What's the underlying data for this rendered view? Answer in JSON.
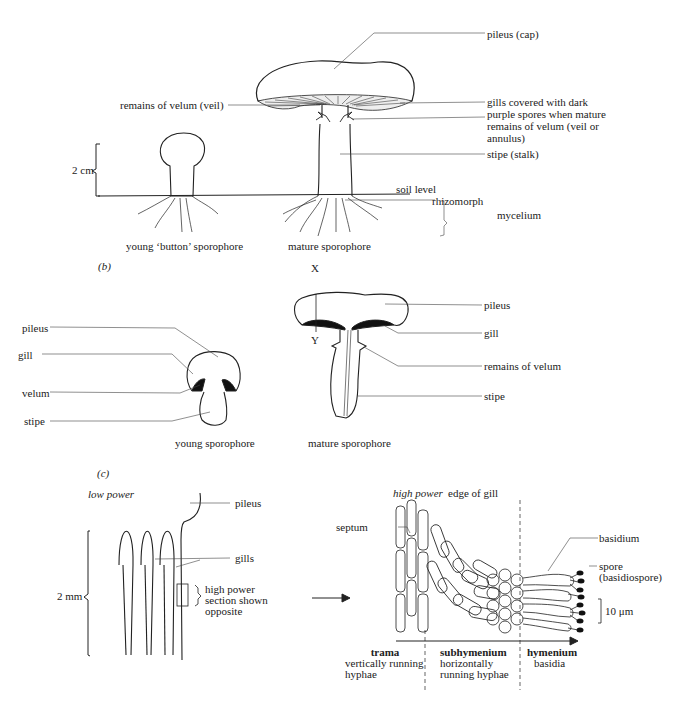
{
  "panel_a": {
    "labels": {
      "pileus": "pileus (cap)",
      "velum": "remains of velum (veil)",
      "gills_line1": "gills covered with dark",
      "gills_line2": "purple spores when mature",
      "annulus_line1": "remains of velum (veil or",
      "annulus_line2": "annulus)",
      "stipe": "stipe (stalk)",
      "soil": "soil level",
      "rhizomorph": "rhizomorph",
      "mycelium": "mycelium",
      "scale": "2 cm",
      "caption_young": "young ‘button’ sporophore",
      "caption_mature": "mature sporophore"
    }
  },
  "panel_b": {
    "tag": "(b)",
    "labels": {
      "x": "X",
      "y": "Y",
      "young_pileus": "pileus",
      "young_gill": "gill",
      "young_velum": "velum",
      "young_stipe": "stipe",
      "mature_pileus": "pileus",
      "mature_gill": "gill",
      "mature_velum": "remains of velum",
      "mature_stipe": "stipe",
      "caption_young": "young sporophore",
      "caption_mature": "mature sporophore"
    }
  },
  "panel_c": {
    "tag": "(c)",
    "labels": {
      "low_power": "low power",
      "pileus": "pileus",
      "gills": "gills",
      "scale": "2 mm",
      "hp_line1": "high power",
      "hp_line2": "section shown",
      "hp_line3": "opposite",
      "high_power": "high power",
      "edge": "edge of gill",
      "septum": "septum",
      "basidium": "basidium",
      "spore_line1": "spore",
      "spore_line2": "(basidiospore)",
      "scale_um": "10 μm",
      "trama": "trama",
      "trama_d1": "vertically running",
      "trama_d2": "hyphae",
      "subhymenium": "subhymenium",
      "sub_d1": "horizontally",
      "sub_d2": "running hyphae",
      "hymenium": "hymenium",
      "hym_d1": "basidia"
    }
  }
}
